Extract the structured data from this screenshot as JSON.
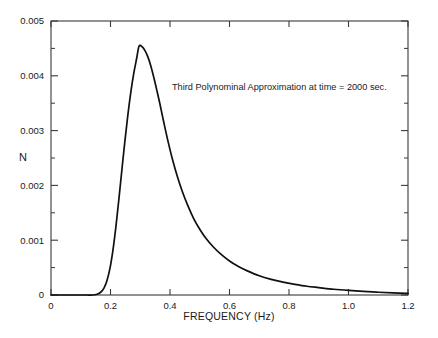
{
  "chart_data": {
    "type": "line",
    "title": "",
    "subtitle": "",
    "xlabel": "FREQUENCY (Hz)",
    "ylabel": "N",
    "xlim": [
      0,
      1.2
    ],
    "ylim": [
      0,
      0.005
    ],
    "grid": false,
    "legend": null,
    "annotations": [
      {
        "text": "Third Polynominal Approximation at time = 2000 sec.",
        "x": 0.41,
        "y": 0.0038
      }
    ],
    "x_ticks": [
      0,
      0.2,
      0.4,
      0.6,
      0.8,
      1.0,
      1.2
    ],
    "x_tick_labels": [
      "0",
      "0.2",
      "0.4",
      "0.6",
      "0.8",
      "1.0",
      "1.2"
    ],
    "y_ticks": [
      0,
      0.001,
      0.002,
      0.003,
      0.004,
      0.005
    ],
    "y_tick_labels": [
      "0",
      "0.001",
      "0.002",
      "0.003",
      "0.004",
      "0.005"
    ],
    "y_minor_ticks": [
      0.0005,
      0.0015,
      0.0025,
      0.0035,
      0.0045
    ],
    "series": [
      {
        "name": "N(f)",
        "color": "#101010",
        "x": [
          0.0,
          0.02,
          0.04,
          0.06,
          0.08,
          0.1,
          0.12,
          0.14,
          0.155,
          0.168,
          0.178,
          0.188,
          0.198,
          0.208,
          0.218,
          0.228,
          0.238,
          0.248,
          0.258,
          0.268,
          0.278,
          0.288,
          0.296,
          0.306,
          0.316,
          0.326,
          0.336,
          0.346,
          0.356,
          0.366,
          0.38,
          0.394,
          0.41,
          0.426,
          0.442,
          0.46,
          0.48,
          0.5,
          0.52,
          0.545,
          0.57,
          0.6,
          0.63,
          0.66,
          0.7,
          0.74,
          0.78,
          0.82,
          0.86,
          0.9,
          0.95,
          1.0,
          1.05,
          1.1,
          1.15,
          1.2
        ],
        "y": [
          0.0,
          0.0,
          0.0,
          0.0,
          0.0,
          0.0,
          0.0,
          0.0,
          1.5e-05,
          5.5e-05,
          0.000125,
          0.00026,
          0.00048,
          0.00081,
          0.00124,
          0.00174,
          0.00227,
          0.00279,
          0.00327,
          0.00369,
          0.00404,
          0.00432,
          0.00454,
          0.00453,
          0.00446,
          0.00434,
          0.00417,
          0.00396,
          0.00373,
          0.00349,
          0.00313,
          0.00279,
          0.00244,
          0.00214,
          0.00188,
          0.00163,
          0.00139,
          0.0012,
          0.00104,
          0.00088,
          0.00075,
          0.00062,
          0.00052,
          0.00044,
          0.00035,
          0.000285,
          0.000235,
          0.000195,
          0.00016,
          0.000135,
          0.000105,
          8.3e-05,
          6.5e-05,
          5e-05,
          3.8e-05,
          2.8e-05
        ]
      }
    ]
  }
}
